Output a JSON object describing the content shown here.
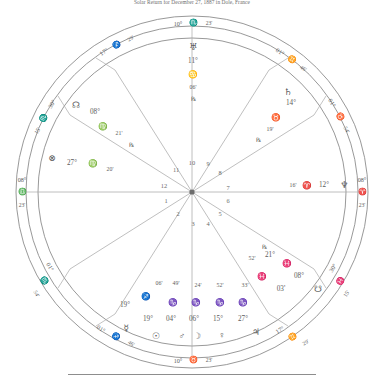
{
  "title": "Solar Return for December 27, 1887 in Dole, France",
  "colors": {
    "line": "#8d8d8d",
    "thin_line": "#a9a9a9",
    "text": "#5c5c5c",
    "background": "#ffffff"
  },
  "glyphs": {
    "aries": "♈",
    "taurus": "♉",
    "gemini": "♊",
    "cancer": "♋",
    "leo": "♌",
    "virgo": "♍",
    "libra": "♎",
    "scorpio": "♏",
    "sagittarius": "♐",
    "capricorn": "♑",
    "aquarius": "♒",
    "pisces": "♓",
    "sun": "☉",
    "moon": "☽",
    "mercury": "☿",
    "venus": "♀",
    "mars": "♂",
    "jupiter": "♃",
    "saturn": "♄",
    "uranus": "♅",
    "neptune": "♆",
    "pluto": "♇",
    "north_node": "☊",
    "south_node": "☋",
    "fortune": "⊗",
    "retrograde": "℞"
  },
  "axis_cusps": [
    {
      "name": "midheaven",
      "degree": "10°",
      "sign": "scorpio",
      "minute": "23'"
    },
    {
      "name": "ascendant",
      "degree": "08°",
      "sign": "libra",
      "minute": "23'"
    },
    {
      "name": "descendant",
      "degree": "08°",
      "sign": "aries",
      "minute": "23'"
    },
    {
      "name": "imum-coeli",
      "degree": "10°",
      "sign": "taurus",
      "minute": "23'"
    }
  ],
  "house_cusps": [
    {
      "house": 11,
      "degree": "17°",
      "sign": "sagittarius",
      "minute": "29'"
    },
    {
      "house": 12,
      "degree": "30°",
      "sign": "scorpio",
      "minute": "15'"
    },
    {
      "house": 2,
      "degree": "01°",
      "sign": "scorpio",
      "minute": "54'"
    },
    {
      "house": 3,
      "degree": "01°",
      "sign": "sagittarius",
      "minute": "46'"
    },
    {
      "house": 5,
      "degree": "17°",
      "sign": "gemini",
      "minute": "29'"
    },
    {
      "house": 6,
      "degree": "30°",
      "sign": "pisces",
      "minute": "15'"
    },
    {
      "house": 8,
      "degree": "01°",
      "sign": "taurus",
      "minute": "54'"
    },
    {
      "house": 9,
      "degree": "01°",
      "sign": "gemini",
      "minute": "46'"
    }
  ],
  "house_numbers": [
    "1",
    "2",
    "3",
    "4",
    "5",
    "6",
    "7",
    "8",
    "9",
    "10",
    "11",
    "12"
  ],
  "placements": [
    {
      "body": "uranus",
      "degree": "11°",
      "sign": "cancer",
      "minute": "06'",
      "retrograde": true
    },
    {
      "body": "north_node",
      "degree": "08°",
      "sign": "virgo",
      "minute": "21'",
      "retrograde": true
    },
    {
      "body": "fortune",
      "degree": "27°",
      "sign": "virgo",
      "minute": "20'",
      "retrograde": false
    },
    {
      "body": "saturn",
      "degree": "14°",
      "sign": "taurus",
      "minute": "19'",
      "retrograde": true
    },
    {
      "body": "neptune",
      "degree": "12°",
      "sign": "aries",
      "minute": "16'",
      "retrograde": false
    },
    {
      "body": "pluto",
      "degree": "21°",
      "sign": "pisces",
      "minute": "52'",
      "retrograde": true
    },
    {
      "body": "south_node",
      "degree": "08°",
      "sign": "pisces",
      "minute": "03'",
      "retrograde": false
    },
    {
      "body": "jupiter",
      "degree": "27°",
      "sign": "capricorn",
      "minute": "33'",
      "retrograde": false
    },
    {
      "body": "venus",
      "degree": "15°",
      "sign": "capricorn",
      "minute": "52'",
      "retrograde": false
    },
    {
      "body": "moon",
      "degree": "06°",
      "sign": "capricorn",
      "minute": "24'",
      "retrograde": false
    },
    {
      "body": "mars",
      "degree": "04°",
      "sign": "capricorn",
      "minute": "49'",
      "retrograde": false
    },
    {
      "body": "sun",
      "degree": "19°",
      "sign": "sagittarius",
      "minute": "06'",
      "retrograde": false
    },
    {
      "body": "mercury",
      "degree": "19°",
      "sign": "sagittarius",
      "minute": "06'",
      "retrograde": false
    }
  ],
  "labels": {
    "mc_deg": "10°",
    "mc_min": "23'",
    "asc_deg": "08°",
    "asc_min": "23'",
    "dsc_deg": "08°",
    "dsc_min": "23'",
    "ic_deg": "10°",
    "ic_min": "23'",
    "c11_deg": "17°",
    "c11_min": "29'",
    "c12_deg": "30°",
    "c12_min": "15'",
    "c2_deg": "01°",
    "c2_min": "54'",
    "c3_deg": "01°",
    "c3_min": "46'",
    "c5_deg": "17°",
    "c5_min": "29'",
    "c6_deg": "30°",
    "c6_min": "15'",
    "c8_deg": "01°",
    "c8_min": "54'",
    "c9_deg": "01°",
    "c9_min": "46'",
    "ura_deg": "11°",
    "ura_min": "06'",
    "nn_deg": "08°",
    "nn_min": "21'",
    "fort_deg": "27°",
    "fort_min": "20'",
    "sat_deg": "14°",
    "sat_min": "19'",
    "nep_deg": "12°",
    "nep_min": "16'",
    "plu_deg": "21°",
    "plu_min": "52'",
    "sn_deg": "08°",
    "sn_min": "03'",
    "jup_deg": "27°",
    "jup_min": "33'",
    "ven_deg": "15°",
    "ven_min": "52'",
    "moon_deg": "06°",
    "moon_min": "24'",
    "mars_deg": "04°",
    "mars_min": "49'",
    "sun_deg": "19°",
    "sun_min": "06'",
    "merc_deg": "19°",
    "merc_min": "06'"
  }
}
